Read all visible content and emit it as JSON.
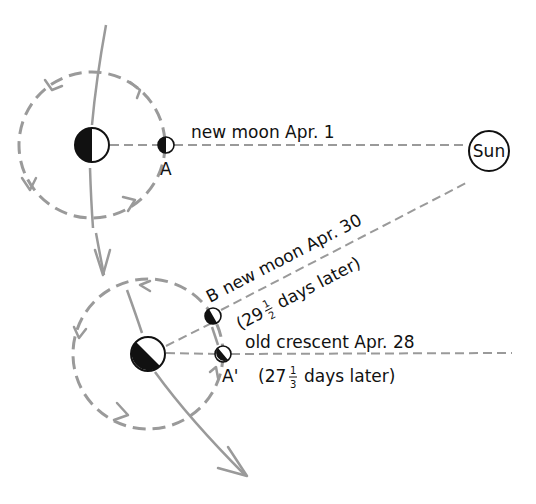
{
  "diagram": {
    "sun_label": "Sun",
    "position_a": {
      "marker": "A",
      "label": "new moon Apr. 1"
    },
    "position_b": {
      "marker": "B",
      "label": "new moon Apr. 30",
      "interval_prefix": "(29",
      "interval_num": "1",
      "interval_den": "2",
      "interval_suffix": "days later)"
    },
    "position_a_prime": {
      "marker": "A'",
      "label": "old crescent Apr. 28",
      "interval_prefix": "(27",
      "interval_num": "1",
      "interval_den": "3",
      "interval_suffix": "days later)"
    },
    "icons": [
      "earth-icon",
      "moon-icon",
      "sun-icon",
      "orbit-arrow-icon",
      "path-arrow-icon"
    ],
    "colors": {
      "line_gray": "#9a9a9a",
      "ink": "#111111",
      "background": "#ffffff"
    }
  }
}
